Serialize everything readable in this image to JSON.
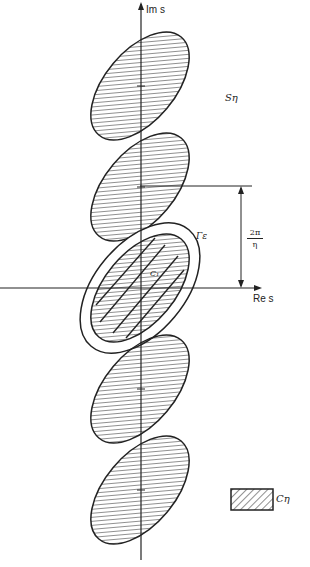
{
  "diagram": {
    "type": "complex-plane diagram",
    "axes": {
      "vertical_label": "Im s",
      "horizontal_label": "Re s"
    },
    "region_label": "Sη",
    "contour_label": "Γε",
    "central_set_label": "C₁",
    "period_label": {
      "numerator": "2π",
      "denominator": "η"
    },
    "legend": {
      "swatch": "hatched",
      "label": "Cη"
    },
    "ellipses": [
      {
        "center_y": 86,
        "highlighted": false
      },
      {
        "center_y": 187,
        "highlighted": false
      },
      {
        "center_y": 288,
        "highlighted": true
      },
      {
        "center_y": 389,
        "highlighted": false
      },
      {
        "center_y": 490,
        "highlighted": false
      }
    ],
    "colors": {
      "ink": "#222222",
      "background": "#ffffff"
    }
  }
}
